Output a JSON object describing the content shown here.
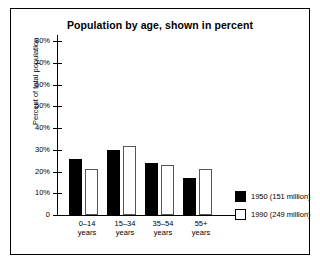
{
  "chart_data": {
    "type": "bar",
    "title": "Population by age, shown in percent",
    "xlabel": "",
    "ylabel": "Percent of total population",
    "categories": [
      "0–14\nyears",
      "15–34\nyears",
      "35–54\nyears",
      "55+\nyears"
    ],
    "category_labels": [
      {
        "line1": "0–14",
        "line2": "years"
      },
      {
        "line1": "15–34",
        "line2": "years"
      },
      {
        "line1": "35–54",
        "line2": "years"
      },
      {
        "line1": "55+",
        "line2": "years"
      }
    ],
    "series": [
      {
        "name": "1950 (151 million)",
        "color": "#000000",
        "values": [
          26,
          30,
          24,
          17
        ]
      },
      {
        "name": "1990 (249 million)",
        "color": "#ffffff",
        "values": [
          21,
          32,
          23,
          21
        ]
      }
    ],
    "ylim": [
      0,
      80
    ],
    "ytick_values": [
      80,
      70,
      60,
      50,
      40,
      30,
      20,
      10,
      0
    ],
    "ytick_labels": [
      "80%",
      "70%",
      "60%",
      "50%",
      "40%",
      "30%",
      "20%",
      "10%",
      "0"
    ],
    "grid": false,
    "legend_position": "right-bottom"
  },
  "legend": {
    "entries": [
      {
        "label": "1950 (151 million)",
        "swatch": "black-filled"
      },
      {
        "label": "1990 (249 million)",
        "swatch": "white-open"
      }
    ]
  }
}
